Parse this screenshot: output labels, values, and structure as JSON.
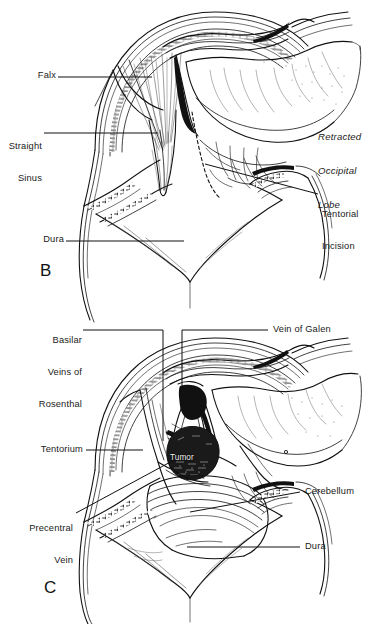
{
  "figure": {
    "ink_color": "#111111",
    "paper_color": "#ffffff",
    "panels": [
      {
        "letter": "B",
        "caption_position": "bottom-left",
        "labels": [
          {
            "name": "falx",
            "text": "Falx",
            "align": "right",
            "italic": false
          },
          {
            "name": "straight-sinus",
            "text": "Straight\nSinus",
            "align": "right",
            "italic": false
          },
          {
            "name": "dura",
            "text": "Dura",
            "align": "right",
            "italic": false
          },
          {
            "name": "retracted-occipital-lobe",
            "text": "Retracted\nOccipital\nLobe",
            "align": "left",
            "italic": true
          },
          {
            "name": "tentorial-incision",
            "text": "Tentorial\nIncision",
            "align": "left",
            "italic": false
          }
        ]
      },
      {
        "letter": "C",
        "caption_position": "bottom-left",
        "labels": [
          {
            "name": "basilar-veins-of-rosenthal",
            "text": "Basilar\nVeins of\nRosenthal",
            "align": "right",
            "italic": false
          },
          {
            "name": "vein-of-galen",
            "text": "Vein of Galen",
            "align": "left",
            "italic": false
          },
          {
            "name": "tentorium",
            "text": "Tentorium",
            "align": "right",
            "italic": false
          },
          {
            "name": "precentral-vein",
            "text": "Precentral\nVein",
            "align": "right",
            "italic": false
          },
          {
            "name": "cerebellum",
            "text": "Cerebellum",
            "align": "left",
            "italic": false
          },
          {
            "name": "dura",
            "text": "Dura",
            "align": "left",
            "italic": false
          },
          {
            "name": "tumor",
            "text": "Tumor",
            "align": "center",
            "italic": false
          }
        ]
      }
    ]
  },
  "panelB": {
    "letter": "B",
    "falx": "Falx",
    "straight_sinus_line1": "Straight",
    "straight_sinus_line2": "Sinus",
    "dura": "Dura",
    "retracted_line1": "Retracted",
    "retracted_line2": "Occipital",
    "retracted_line3": "Lobe",
    "tentorial_line1": "Tentorial",
    "tentorial_line2": "Incision"
  },
  "panelC": {
    "letter": "C",
    "basilar_line1": "Basilar",
    "basilar_line2": "Veins of",
    "basilar_line3": "Rosenthal",
    "vein_of_galen": "Vein of Galen",
    "tentorium": "Tentorium",
    "precentral_line1": "Precentral",
    "precentral_line2": "Vein",
    "cerebellum": "Cerebellum",
    "dura": "Dura",
    "tumor": "Tumor"
  }
}
